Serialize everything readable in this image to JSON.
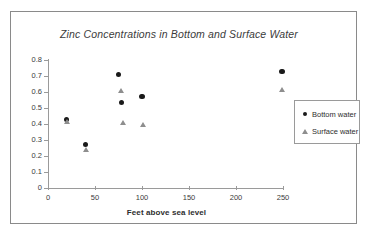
{
  "chart_data": {
    "type": "scatter",
    "title": "Zinc Concentrations in Bottom and Surface Water",
    "xlabel": "Feet above sea level",
    "ylabel": "",
    "xlim": [
      0,
      250
    ],
    "ylim": [
      0,
      0.8
    ],
    "xticks": [
      "0",
      "50",
      "100",
      "150",
      "200",
      "250"
    ],
    "xtick_values": [
      0,
      50,
      100,
      150,
      200,
      250
    ],
    "yticks": [
      "0",
      "0.1",
      "0.2",
      "0.3",
      "0.4",
      "0.5",
      "0.6",
      "0.7",
      "0.8"
    ],
    "ytick_values": [
      0,
      0.1,
      0.2,
      0.3,
      0.4,
      0.5,
      0.6,
      0.7,
      0.8
    ],
    "grid": false,
    "legend_position": "right",
    "series": [
      {
        "name": "Bottom water",
        "marker": "filled-circle",
        "color": "#1a1a1a",
        "points": [
          {
            "x": 20,
            "y": 0.43
          },
          {
            "x": 40,
            "y": 0.27
          },
          {
            "x": 75,
            "y": 0.71
          },
          {
            "x": 78,
            "y": 0.535
          },
          {
            "x": 100,
            "y": 0.57
          },
          {
            "x": 249,
            "y": 0.73
          }
        ]
      },
      {
        "name": "Surface water",
        "marker": "open-triangle",
        "color": "#8e8e8e",
        "points": [
          {
            "x": 20,
            "y": 0.415
          },
          {
            "x": 40,
            "y": 0.24
          },
          {
            "x": 78,
            "y": 0.605
          },
          {
            "x": 80,
            "y": 0.41
          },
          {
            "x": 101,
            "y": 0.395
          },
          {
            "x": 249,
            "y": 0.615
          }
        ]
      }
    ]
  }
}
